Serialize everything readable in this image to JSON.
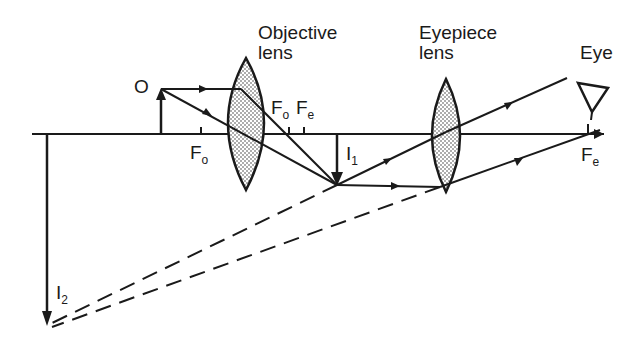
{
  "labels": {
    "objective_lens": [
      "Objective",
      "lens"
    ],
    "eyepiece_lens": [
      "Eyepiece",
      "lens"
    ],
    "eye": "Eye",
    "object": "O",
    "fo_left": {
      "main": "F",
      "sub": "o"
    },
    "fo_right": {
      "main": "F",
      "sub": "o"
    },
    "fe_mid": {
      "main": "F",
      "sub": "e"
    },
    "fe_right": {
      "main": "F",
      "sub": "e"
    },
    "image1": {
      "main": "I",
      "sub": "1"
    },
    "image2": {
      "main": "I",
      "sub": "2"
    }
  },
  "colors": {
    "ink": "#1a1a1a",
    "lens_fill": "#d8d8d8",
    "background": "#ffffff"
  }
}
